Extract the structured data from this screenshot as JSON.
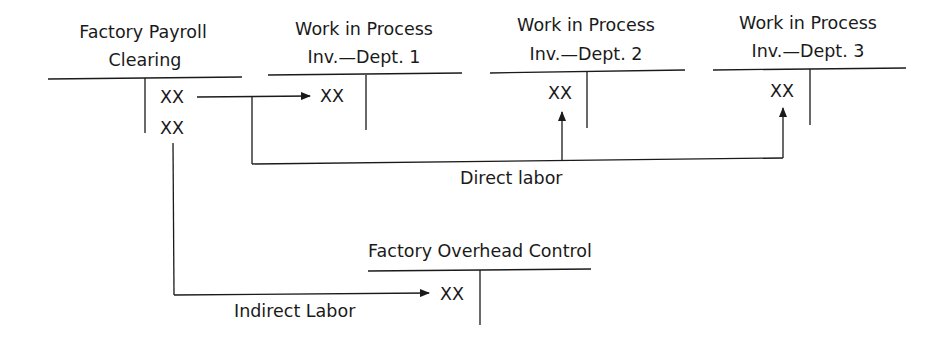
{
  "diagram": {
    "type": "t-account flow",
    "accounts": [
      {
        "id": "payroll",
        "title_line1": "Factory Payroll",
        "title_line2": "Clearing",
        "credits": [
          "XX",
          "XX"
        ]
      },
      {
        "id": "wip1",
        "title_line1": "Work in Process",
        "title_line2": "Inv.—Dept. 1",
        "debits": [
          "XX"
        ]
      },
      {
        "id": "wip2",
        "title_line1": "Work in Process",
        "title_line2": "Inv.—Dept. 2",
        "debits": [
          "XX"
        ]
      },
      {
        "id": "wip3",
        "title_line1": "Work in Process",
        "title_line2": "Inv.—Dept. 3",
        "debits": [
          "XX"
        ]
      },
      {
        "id": "foh",
        "title_line1": "Factory Overhead Control",
        "debits": [
          "XX"
        ]
      }
    ],
    "flows": [
      {
        "label": "Direct labor",
        "from": "payroll",
        "to": [
          "wip1",
          "wip2",
          "wip3"
        ]
      },
      {
        "label": "Indirect Labor",
        "from": "payroll",
        "to": [
          "foh"
        ]
      }
    ],
    "line_color": "#1a1a1a"
  }
}
